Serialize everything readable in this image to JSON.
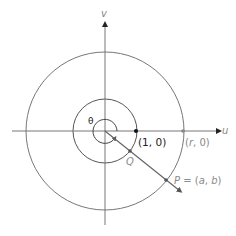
{
  "diagram": {
    "axes": {
      "horizontal_label": "u",
      "vertical_label": "v"
    },
    "angle_label": "θ",
    "points": {
      "unit_point": "(1, 0)",
      "r_point_r": "r",
      "r_point_rest": ", 0)",
      "r_point_open": "(",
      "q_label": "Q",
      "p_label_p": "P",
      "p_label_eq": " = (",
      "p_label_a": "a",
      "p_label_comma": ", ",
      "p_label_b": "b",
      "p_label_close": ")"
    },
    "colors": {
      "line": "#777777",
      "dark_point": "#111111",
      "label_dark": "#222222",
      "label_gray": "#8a8a8a"
    }
  }
}
